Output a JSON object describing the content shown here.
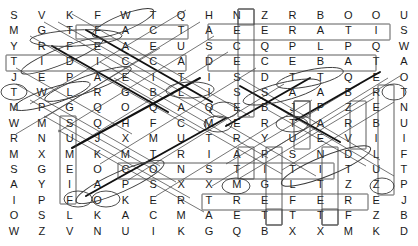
{
  "puzzle": {
    "title": "Word Search Puzzle",
    "rows": 15,
    "cols": 15,
    "cell_width": 27.867,
    "cell_height": 15.4,
    "origin_x": 0,
    "origin_y": 8,
    "letter_color": "#1a1a1a",
    "marker_color": "#333333",
    "highlight_color": "#999999",
    "background": "#ffffff",
    "grid": [
      [
        "S",
        "V",
        "K",
        "F",
        "W",
        "T",
        "Q",
        "H",
        "N",
        "Z",
        "R",
        "B",
        "O",
        "O",
        "U"
      ],
      [
        "M",
        "G",
        "T",
        "F",
        "A",
        "C",
        "T",
        "A",
        "E",
        "E",
        "R",
        "A",
        "T",
        "I",
        "S"
      ],
      [
        "Y",
        "R",
        "F",
        "E",
        "A",
        "E",
        "U",
        "S",
        "C",
        "Q",
        "P",
        "L",
        "P",
        "Q",
        "W"
      ],
      [
        "T",
        "I",
        "D",
        "I",
        "C",
        "C",
        "A",
        "D",
        "E",
        "C",
        "E",
        "B",
        "A",
        "T",
        "A"
      ],
      [
        "J",
        "E",
        "P",
        "A",
        "E",
        "I",
        "T",
        "I",
        "S",
        "D",
        "T",
        "T",
        "Q",
        "E",
        "O"
      ],
      [
        "T",
        "W",
        "L",
        "R",
        "G",
        "B",
        "L",
        "I",
        "S",
        "S",
        "A",
        "A",
        "B",
        "R",
        "T"
      ],
      [
        "M",
        "P",
        "G",
        "Q",
        "O",
        "Q",
        "A",
        "Q",
        "E",
        "B",
        "J",
        "P",
        "Z",
        "E",
        "N"
      ],
      [
        "W",
        "M",
        "S",
        "Q",
        "H",
        "F",
        "C",
        "M",
        "E",
        "R",
        "T",
        "A",
        "R",
        "B",
        "U"
      ],
      [
        "R",
        "N",
        "U",
        "J",
        "X",
        "M",
        "U",
        "T",
        "R",
        "Y",
        "U",
        "E",
        "V",
        "I",
        "I"
      ],
      [
        "M",
        "X",
        "M",
        "K",
        "M",
        "T",
        "R",
        "I",
        "A",
        "P",
        "S",
        "N",
        "D",
        "L",
        "F"
      ],
      [
        "S",
        "G",
        "E",
        "O",
        "C",
        "O",
        "N",
        "S",
        "T",
        "I",
        "T",
        "I",
        "T",
        "U",
        "T"
      ],
      [
        "A",
        "Y",
        "I",
        "A",
        "P",
        "S",
        "X",
        "X",
        "M",
        "G",
        "L",
        "T",
        "Z",
        "Z",
        "P"
      ],
      [
        "I",
        "P",
        "F",
        "O",
        "K",
        "E",
        "R",
        "T",
        "R",
        "E",
        "F",
        "E",
        "R",
        "E",
        "J"
      ],
      [
        "O",
        "S",
        "L",
        "K",
        "A",
        "C",
        "M",
        "A",
        "E",
        "T",
        "T",
        "T",
        "F",
        "Z",
        "B"
      ],
      [
        "W",
        "Z",
        "V",
        "N",
        "U",
        "I",
        "K",
        "G",
        "Q",
        "B",
        "X",
        "X",
        "M",
        "K",
        "D"
      ]
    ],
    "row_tops": [
      8,
      23.4,
      38.8,
      54.2,
      69.6,
      85,
      100.4,
      115.8,
      131.2,
      146.6,
      162,
      177.4,
      192.8,
      208.2,
      223.6
    ],
    "found_words": [
      {
        "name": "fact",
        "text": "FACT",
        "shape": "ellipse",
        "orientation": "horizontal",
        "start": [
          1,
          2
        ],
        "end": [
          1,
          6
        ]
      },
      {
        "name": "tidicca-row",
        "text": "TIDICCA",
        "shape": "rectangle",
        "orientation": "horizontal",
        "start": [
          3,
          0
        ],
        "end": [
          3,
          6
        ]
      },
      {
        "name": "necese-col",
        "text": "NECESE",
        "shape": "rectangle",
        "orientation": "vertical",
        "start": [
          0,
          8
        ],
        "end": [
          7,
          8
        ]
      },
      {
        "name": "aeeratis",
        "text": "AEERATIS",
        "shape": "rectangle",
        "orientation": "horizontal",
        "start": [
          1,
          7
        ],
        "end": [
          1,
          14
        ]
      },
      {
        "name": "decebat",
        "text": "DECEBAT",
        "shape": "rectangle",
        "orientation": "horizontal",
        "start": [
          3,
          7
        ],
        "end": [
          3,
          13
        ]
      },
      {
        "name": "constit",
        "text": "CONSTIT",
        "shape": "rectangle",
        "orientation": "horizontal",
        "start": [
          10,
          4
        ],
        "end": [
          10,
          12
        ]
      },
      {
        "name": "trefer",
        "text": "TREFER",
        "shape": "rectangle",
        "orientation": "horizontal",
        "start": [
          12,
          6
        ],
        "end": [
          12,
          12
        ]
      },
      {
        "name": "sumeif",
        "text": "SUMEIF",
        "shape": "rectangle",
        "orientation": "vertical",
        "start": [
          7,
          2
        ],
        "end": [
          12,
          2
        ]
      },
      {
        "name": "pzebl",
        "text": "PZEBL",
        "shape": "rectangle",
        "orientation": "vertical",
        "start": [
          6,
          11
        ],
        "end": [
          9,
          11
        ]
      },
      {
        "name": "evii-col",
        "text": "EVII",
        "shape": "rectangle",
        "orientation": "vertical",
        "start": [
          6,
          13
        ],
        "end": [
          9,
          13
        ]
      },
      {
        "name": "tnuift",
        "text": "TNUIFT",
        "shape": "rectangle",
        "orientation": "vertical",
        "start": [
          5,
          14
        ],
        "end": [
          10,
          14
        ]
      },
      {
        "name": "piget",
        "text": "PIGET",
        "shape": "rectangle",
        "orientation": "vertical",
        "start": [
          9,
          10
        ],
        "end": [
          13,
          10
        ]
      },
      {
        "name": "nitet",
        "text": "NITET",
        "shape": "rectangle",
        "orientation": "vertical",
        "start": [
          9,
          12
        ],
        "end": [
          13,
          12
        ]
      },
      {
        "name": "tt-col",
        "text": "TT",
        "shape": "rectangle",
        "orientation": "vertical",
        "start": [
          13,
          9
        ],
        "end": [
          13,
          9
        ]
      },
      {
        "name": "n-single",
        "text": "N",
        "shape": "rectangle",
        "orientation": "single",
        "start": [
          0,
          8
        ],
        "end": [
          0,
          8
        ]
      },
      {
        "name": "p-single",
        "text": "P",
        "shape": "rectangle",
        "orientation": "single",
        "start": [
          6,
          11
        ],
        "end": [
          6,
          11
        ]
      },
      {
        "name": "t-single",
        "text": "T",
        "shape": "rectangle",
        "orientation": "single",
        "start": [
          13,
          11
        ],
        "end": [
          13,
          11
        ]
      }
    ],
    "circled_letters": [
      {
        "name": "circle-t-r0c5",
        "row": 0,
        "col": 5
      },
      {
        "name": "circle-t-r1c2",
        "row": 1,
        "col": 2
      },
      {
        "name": "circle-t-r1c6",
        "row": 1,
        "col": 6
      },
      {
        "name": "circle-f-r2c2",
        "row": 2,
        "col": 2
      },
      {
        "name": "circle-p-r4c2",
        "row": 4,
        "col": 2
      },
      {
        "name": "circle-t-r5c0",
        "row": 5,
        "col": 0
      },
      {
        "name": "circle-l-r5c6",
        "row": 5,
        "col": 6
      },
      {
        "name": "circle-i-r5c7",
        "row": 5,
        "col": 7
      },
      {
        "name": "circle-t-r5c14",
        "row": 5,
        "col": 14
      },
      {
        "name": "circle-p-r6c1",
        "row": 6,
        "col": 1
      },
      {
        "name": "circle-e-r6c8",
        "row": 6,
        "col": 8
      },
      {
        "name": "circle-m-r7c7",
        "row": 7,
        "col": 7
      },
      {
        "name": "circle-t-r7c10",
        "row": 7,
        "col": 10
      },
      {
        "name": "circle-m-r11c8",
        "row": 11,
        "col": 8
      },
      {
        "name": "circle-p-r11c14",
        "row": 11,
        "col": 14
      },
      {
        "name": "circle-f-r12c2",
        "row": 12,
        "col": 2
      },
      {
        "name": "circle-o-r12c3",
        "row": 12,
        "col": 3
      },
      {
        "name": "circle-t-r4c11",
        "row": 4,
        "col": 11
      },
      {
        "name": "circle-t-r4c12",
        "row": 4,
        "col": 12
      },
      {
        "name": "circle-t-r10c11",
        "row": 10,
        "col": 11
      }
    ]
  }
}
